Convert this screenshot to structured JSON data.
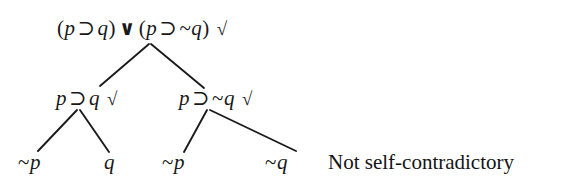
{
  "diagram": {
    "type": "truth-tree",
    "title_text": "",
    "background_color": "#ffffff",
    "ink_color": "#181818",
    "symbols": {
      "horseshoe": "⊃",
      "wedge": "∨",
      "tilde": "~",
      "check": "√"
    },
    "nodes": {
      "root": {
        "label": "(p ⊃ q) ∨ (p ⊃ ~q) √",
        "left_paren": "(",
        "left_p": "p",
        "left_op": "⊃",
        "left_q": "q",
        "right_paren_close": ")",
        "connective": "∨",
        "right_paren_open": "(",
        "right_p": "p",
        "right_op": "⊃",
        "right_neg": "~",
        "right_q": "q",
        "close_paren": ")",
        "check": "√"
      },
      "left_branch": {
        "label": "p ⊃ q √",
        "p": "p",
        "op": "⊃",
        "q": "q",
        "check": "√"
      },
      "right_branch": {
        "label": "p ⊃ ~q √",
        "p": "p",
        "op": "⊃",
        "neg": "~",
        "q": "q",
        "check": "√"
      },
      "leaf_1": {
        "label": "~p",
        "neg": "~",
        "atom": "p"
      },
      "leaf_2": {
        "label": "q",
        "atom": "q"
      },
      "leaf_3": {
        "label": "~p",
        "neg": "~",
        "atom": "p"
      },
      "leaf_4": {
        "label": "~q",
        "neg": "~",
        "atom": "q"
      }
    },
    "verdict": {
      "text": "Not self-contradictory"
    }
  }
}
